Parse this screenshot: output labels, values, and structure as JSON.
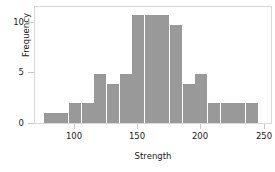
{
  "chart_data": {
    "type": "bar",
    "title": "",
    "subtitle": "",
    "xlabel": "Strength",
    "ylabel": "Frequency",
    "bin_width": 10,
    "bin_starts": [
      75,
      85,
      95,
      105,
      115,
      125,
      135,
      145,
      155,
      165,
      175,
      185,
      195,
      205,
      215,
      225,
      235
    ],
    "categories": [
      "75-85",
      "85-95",
      "95-105",
      "105-115",
      "115-125",
      "125-135",
      "135-145",
      "145-155",
      "155-165",
      "165-175",
      "175-185",
      "185-195",
      "195-205",
      "205-215",
      "215-225",
      "225-235",
      "235-245"
    ],
    "values": [
      1,
      1,
      2,
      2,
      5,
      4,
      5,
      11,
      11,
      11,
      10,
      4,
      5,
      2,
      2,
      2,
      2
    ],
    "xlim": [
      68,
      255
    ],
    "ylim": [
      0,
      11.8
    ],
    "xticks": [
      100,
      150,
      200,
      250
    ],
    "xticklabels": [
      "100",
      "150",
      "200",
      "250"
    ],
    "yticks": [
      0,
      5,
      10
    ],
    "yticklabels": [
      "0",
      "5",
      "10"
    ],
    "grid": false,
    "legend": null,
    "bar_color": "#999999",
    "frame_color": "#d9d9d9",
    "background": "#ffffff",
    "text_color": "#1a1a1a"
  }
}
